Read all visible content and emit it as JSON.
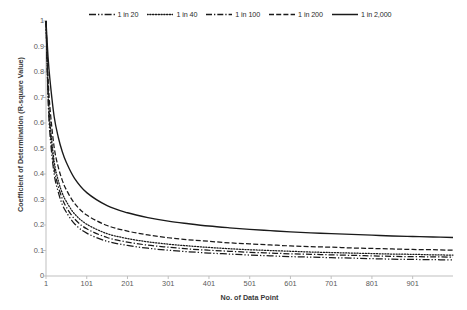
{
  "chart_data": {
    "type": "line",
    "title": "",
    "xlabel": "No. of Data Point",
    "ylabel": "Coefficient of Determination (R-square Value)",
    "xlim": [
      1,
      1000
    ],
    "ylim": [
      0,
      1
    ],
    "grid": false,
    "legend_position": "top",
    "x_ticks": [
      "1",
      "101",
      "201",
      "301",
      "401",
      "501",
      "601",
      "701",
      "801",
      "901"
    ],
    "x_tick_values": [
      1,
      101,
      201,
      301,
      401,
      501,
      601,
      701,
      801,
      901
    ],
    "y_ticks": [
      "0",
      "0.1",
      "0.2",
      "0.3",
      "0.4",
      "0.5",
      "0.6",
      "0.7",
      "0.8",
      "0.9",
      "1"
    ],
    "y_tick_values": [
      0,
      0.1,
      0.2,
      0.3,
      0.4,
      0.5,
      0.6,
      0.7,
      0.8,
      0.9,
      1
    ],
    "x": [
      1,
      6,
      11,
      21,
      31,
      41,
      51,
      71,
      101,
      151,
      201,
      251,
      301,
      351,
      401,
      451,
      501,
      551,
      601,
      651,
      701,
      751,
      801,
      851,
      901,
      951,
      1000
    ],
    "series": [
      {
        "name": "1 in 20",
        "dash": "dash-dot-dot",
        "values": [
          1.0,
          0.7,
          0.55,
          0.4,
          0.33,
          0.28,
          0.25,
          0.205,
          0.168,
          0.136,
          0.12,
          0.109,
          0.101,
          0.095,
          0.09,
          0.086,
          0.082,
          0.079,
          0.076,
          0.074,
          0.072,
          0.07,
          0.068,
          0.066,
          0.065,
          0.064,
          0.063
        ]
      },
      {
        "name": "1 in 40",
        "dash": "dotted",
        "values": [
          1.0,
          0.74,
          0.6,
          0.45,
          0.375,
          0.325,
          0.292,
          0.244,
          0.203,
          0.166,
          0.147,
          0.134,
          0.125,
          0.118,
          0.112,
          0.107,
          0.103,
          0.1,
          0.097,
          0.094,
          0.092,
          0.09,
          0.088,
          0.086,
          0.085,
          0.083,
          0.082
        ]
      },
      {
        "name": "1 in 100",
        "dash": "dash-dot",
        "values": [
          1.0,
          0.72,
          0.575,
          0.425,
          0.352,
          0.303,
          0.27,
          0.224,
          0.185,
          0.151,
          0.133,
          0.121,
          0.113,
          0.106,
          0.101,
          0.097,
          0.093,
          0.09,
          0.087,
          0.085,
          0.083,
          0.081,
          0.079,
          0.077,
          0.076,
          0.075,
          0.074
        ]
      },
      {
        "name": "1 in 200",
        "dash": "dashed",
        "values": [
          1.0,
          0.78,
          0.655,
          0.505,
          0.428,
          0.375,
          0.338,
          0.285,
          0.239,
          0.198,
          0.176,
          0.161,
          0.15,
          0.142,
          0.136,
          0.13,
          0.126,
          0.122,
          0.118,
          0.115,
          0.113,
          0.11,
          0.108,
          0.106,
          0.104,
          0.103,
          0.101
        ]
      },
      {
        "name": "1 in 2,000",
        "dash": "solid",
        "values": [
          1.0,
          0.86,
          0.765,
          0.625,
          0.545,
          0.487,
          0.445,
          0.383,
          0.327,
          0.276,
          0.248,
          0.229,
          0.215,
          0.205,
          0.196,
          0.189,
          0.183,
          0.178,
          0.173,
          0.169,
          0.166,
          0.163,
          0.16,
          0.157,
          0.155,
          0.153,
          0.151
        ]
      }
    ]
  },
  "legend": {
    "entries": [
      {
        "label": "1 in 20"
      },
      {
        "label": "1 in 40"
      },
      {
        "label": "1 in 100"
      },
      {
        "label": "1 in 200"
      },
      {
        "label": "1 in 2,000"
      }
    ]
  },
  "colors": {
    "line": "#1a1a1a",
    "axis": "#bfbfbf",
    "tick_text": "#5a5a5a",
    "title_text": "#3a3a3a",
    "background": "#ffffff"
  }
}
